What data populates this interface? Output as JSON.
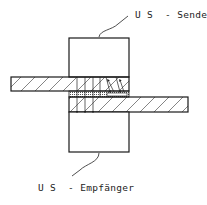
{
  "diagram": {
    "type": "ultrasonic transmission weld inspection",
    "labels": {
      "sender": "U S  - Sender",
      "receiver": "U S  - Empfänger"
    },
    "components": [
      "US sender transducer",
      "upper sheet",
      "weld zone",
      "lower sheet",
      "US receiver transducer"
    ],
    "colors": {
      "line": "#1a1a1a",
      "background": "#ffffff"
    }
  }
}
